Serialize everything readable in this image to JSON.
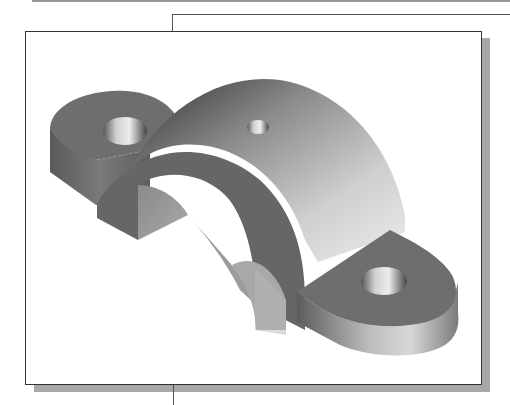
{
  "figure": {
    "type": "isometric-3d-cad-part",
    "features": [
      {
        "name": "arch",
        "description": "half-cylinder shell body"
      },
      {
        "name": "left-lug",
        "description": "rounded mounting lug with through hole"
      },
      {
        "name": "right-lug",
        "description": "rounded mounting lug with through hole"
      },
      {
        "name": "top-hole",
        "description": "small hole on top of arch"
      }
    ],
    "colors": {
      "frame_border": "#333333",
      "frame_shadow": "#a8a8a8",
      "top_rule": "#9a9a9a",
      "connector_line": "#555555",
      "flat_face": "#6e6e6e",
      "dark_face": "#555555",
      "highlight": "#e6e6e6"
    }
  }
}
